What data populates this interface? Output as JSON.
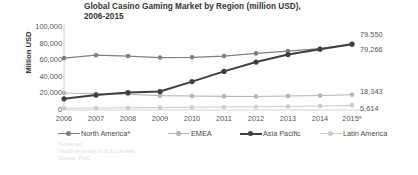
{
  "chart_data": {
    "type": "line",
    "title": "Global Casino Gaming Market by Region (million USD), 2006-2015",
    "title_line1": "Global Casino Gaming Market by Region (million USD),",
    "title_line2": "2006-2015",
    "xlabel": "",
    "ylabel": "Million USD",
    "categories": [
      "2006",
      "2007",
      "2008",
      "2009",
      "2010",
      "2011",
      "2012",
      "2013",
      "2014",
      "2015*"
    ],
    "ylim": [
      0,
      100000
    ],
    "yticks": [
      "0",
      "20,000",
      "40,000",
      "60,000",
      "80,000",
      "100,000"
    ],
    "ytick_values": [
      0,
      20000,
      40000,
      60000,
      80000,
      100000
    ],
    "grid": false,
    "legend_position": "bottom",
    "series": [
      {
        "name": "North America*",
        "color": "#808080",
        "width": 1.3,
        "values": [
          62500,
          66000,
          65000,
          63200,
          63500,
          65000,
          68200,
          71000,
          74000,
          79550
        ],
        "end_label": "79,550"
      },
      {
        "name": "EMEA",
        "color": "#b5b5b5",
        "width": 1.1,
        "values": [
          20400,
          19600,
          18900,
          17300,
          16800,
          16400,
          16200,
          16800,
          17500,
          18343
        ],
        "end_label": "18,343"
      },
      {
        "name": "Asia Pacific",
        "color": "#3f3f3f",
        "width": 2.0,
        "values": [
          13500,
          18000,
          21000,
          22300,
          34200,
          46500,
          57800,
          66800,
          73200,
          79266
        ],
        "end_label": "79,266"
      },
      {
        "name": "Latin America",
        "color": "#cccccc",
        "width": 1.1,
        "values": [
          2100,
          2400,
          2800,
          2900,
          3300,
          3600,
          3900,
          4300,
          4900,
          5614
        ],
        "end_label": "5,614"
      }
    ]
  },
  "footnotes": [
    "*Forecast",
    "*North America: U.S & Canada",
    "Source: PwC"
  ]
}
